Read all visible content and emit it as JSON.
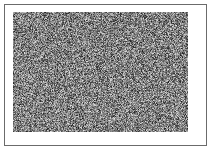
{
  "panel": {
    "name": "noise-figure-panel",
    "width": 211,
    "height": 150,
    "background_color": "#ffffff"
  },
  "frame": {
    "name": "figure-border",
    "x": 4,
    "y": 4,
    "width": 203,
    "height": 142,
    "border_width": 1,
    "border_color": "#6b6b6b",
    "fill_color": "#ffffff"
  },
  "matte": {
    "name": "white-matte",
    "x": 5,
    "y": 5,
    "width": 201,
    "height": 140,
    "color": "#ffffff"
  },
  "noise_block": {
    "name": "random-noise-texture",
    "x": 13,
    "y": 12,
    "width": 175,
    "height": 120,
    "pixel_size": 1,
    "type": "grayscale-random-static",
    "mean_gray": 128,
    "min_gray": 0,
    "max_gray": 255,
    "seed": 20240517,
    "alt_text": "Block of dense random grayscale pixel noise"
  }
}
